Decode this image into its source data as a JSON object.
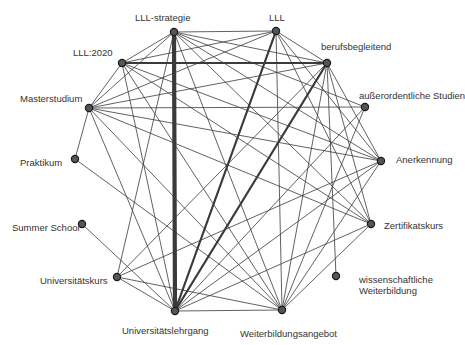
{
  "diagram": {
    "type": "network",
    "nodes": [
      {
        "id": "lll-strategie",
        "label": "LLL-strategie",
        "x": 174,
        "y": 32,
        "lx": 135,
        "ly": 12
      },
      {
        "id": "lll",
        "label": "LLL",
        "x": 276,
        "y": 31,
        "lx": 269,
        "ly": 12
      },
      {
        "id": "lll2020",
        "label": "LLL:2020",
        "x": 122,
        "y": 63,
        "lx": 73,
        "ly": 47
      },
      {
        "id": "berufsbegleitend",
        "label": "berufsbegleitend",
        "x": 327,
        "y": 63,
        "lx": 321,
        "ly": 41
      },
      {
        "id": "masterstudium",
        "label": "Masterstudium",
        "x": 89,
        "y": 108,
        "lx": 20,
        "ly": 93
      },
      {
        "id": "ausserordentliche",
        "label": "außerordentliche Studien",
        "x": 365,
        "y": 107,
        "lx": 359,
        "ly": 90
      },
      {
        "id": "praktikum",
        "label": "Praktikum",
        "x": 75,
        "y": 159,
        "lx": 20,
        "ly": 157
      },
      {
        "id": "anerkennung",
        "label": "Anerkennung",
        "x": 381,
        "y": 161,
        "lx": 396,
        "ly": 154
      },
      {
        "id": "summerschool",
        "label": "Summer School",
        "x": 82,
        "y": 224,
        "lx": 12,
        "ly": 222
      },
      {
        "id": "zertifikatskurs",
        "label": "Zertifikatskurs",
        "x": 371,
        "y": 224,
        "lx": 384,
        "ly": 220
      },
      {
        "id": "universitaetskurs",
        "label": "Universitätskurs",
        "x": 117,
        "y": 277,
        "lx": 40,
        "ly": 275
      },
      {
        "id": "wissenschaftliche",
        "label": "wissenschaftliche",
        "label2": "Weiterbildung",
        "x": 336,
        "y": 276,
        "lx": 359,
        "ly": 274
      },
      {
        "id": "universitaetslehrgang",
        "label": "Universitätslehrgang",
        "x": 175,
        "y": 311,
        "lx": 122,
        "ly": 325
      },
      {
        "id": "weiterbildungsangebot",
        "label": "Weiterbildungsangebot",
        "x": 282,
        "y": 310,
        "lx": 240,
        "ly": 328
      }
    ],
    "edges": [
      {
        "s": "lll-strategie",
        "t": "universitaetslehrgang",
        "w": 4.2
      },
      {
        "s": "lll2020",
        "t": "berufsbegleitend",
        "w": 2.0
      },
      {
        "s": "lll",
        "t": "universitaetslehrgang",
        "w": 2.2
      },
      {
        "s": "berufsbegleitend",
        "t": "universitaetslehrgang",
        "w": 2.2
      },
      {
        "s": "lll-strategie",
        "t": "lll",
        "w": 0.8
      },
      {
        "s": "lll-strategie",
        "t": "lll2020",
        "w": 0.8
      },
      {
        "s": "lll-strategie",
        "t": "masterstudium",
        "w": 0.8
      },
      {
        "s": "lll-strategie",
        "t": "berufsbegleitend",
        "w": 0.8
      },
      {
        "s": "lll-strategie",
        "t": "anerkennung",
        "w": 0.8
      },
      {
        "s": "lll-strategie",
        "t": "zertifikatskurs",
        "w": 0.8
      },
      {
        "s": "lll-strategie",
        "t": "weiterbildungsangebot",
        "w": 0.8
      },
      {
        "s": "lll-strategie",
        "t": "universitaetskurs",
        "w": 0.8
      },
      {
        "s": "lll-strategie",
        "t": "ausserordentliche",
        "w": 0.8
      },
      {
        "s": "lll",
        "t": "lll2020",
        "w": 0.8
      },
      {
        "s": "lll",
        "t": "masterstudium",
        "w": 0.8
      },
      {
        "s": "lll",
        "t": "berufsbegleitend",
        "w": 0.8
      },
      {
        "s": "lll",
        "t": "anerkennung",
        "w": 0.8
      },
      {
        "s": "lll",
        "t": "zertifikatskurs",
        "w": 0.8
      },
      {
        "s": "lll",
        "t": "weiterbildungsangebot",
        "w": 0.8
      },
      {
        "s": "lll2020",
        "t": "masterstudium",
        "w": 0.8
      },
      {
        "s": "lll2020",
        "t": "anerkennung",
        "w": 0.8
      },
      {
        "s": "lll2020",
        "t": "zertifikatskurs",
        "w": 0.8
      },
      {
        "s": "lll2020",
        "t": "universitaetslehrgang",
        "w": 0.8
      },
      {
        "s": "lll2020",
        "t": "weiterbildungsangebot",
        "w": 0.8
      },
      {
        "s": "berufsbegleitend",
        "t": "masterstudium",
        "w": 0.8
      },
      {
        "s": "berufsbegleitend",
        "t": "anerkennung",
        "w": 0.8
      },
      {
        "s": "berufsbegleitend",
        "t": "zertifikatskurs",
        "w": 0.8
      },
      {
        "s": "berufsbegleitend",
        "t": "weiterbildungsangebot",
        "w": 0.8
      },
      {
        "s": "berufsbegleitend",
        "t": "wissenschaftliche",
        "w": 0.8
      },
      {
        "s": "berufsbegleitend",
        "t": "universitaetskurs",
        "w": 0.8
      },
      {
        "s": "masterstudium",
        "t": "ausserordentliche",
        "w": 0.8
      },
      {
        "s": "masterstudium",
        "t": "anerkennung",
        "w": 0.8
      },
      {
        "s": "masterstudium",
        "t": "zertifikatskurs",
        "w": 0.8
      },
      {
        "s": "masterstudium",
        "t": "universitaetslehrgang",
        "w": 0.8
      },
      {
        "s": "masterstudium",
        "t": "weiterbildungsangebot",
        "w": 0.8
      },
      {
        "s": "masterstudium",
        "t": "praktikum",
        "w": 0.8
      },
      {
        "s": "ausserordentliche",
        "t": "universitaetslehrgang",
        "w": 0.8
      },
      {
        "s": "ausserordentliche",
        "t": "weiterbildungsangebot",
        "w": 0.8
      },
      {
        "s": "anerkennung",
        "t": "universitaetslehrgang",
        "w": 0.8
      },
      {
        "s": "anerkennung",
        "t": "weiterbildungsangebot",
        "w": 0.8
      },
      {
        "s": "anerkennung",
        "t": "universitaetskurs",
        "w": 0.8
      },
      {
        "s": "zertifikatskurs",
        "t": "universitaetslehrgang",
        "w": 0.8
      },
      {
        "s": "zertifikatskurs",
        "t": "weiterbildungsangebot",
        "w": 0.8
      },
      {
        "s": "praktikum",
        "t": "weiterbildungsangebot",
        "w": 0.8
      },
      {
        "s": "summerschool",
        "t": "universitaetslehrgang",
        "w": 0.8
      },
      {
        "s": "universitaetskurs",
        "t": "universitaetslehrgang",
        "w": 0.8
      },
      {
        "s": "universitaetskurs",
        "t": "weiterbildungsangebot",
        "w": 0.8
      },
      {
        "s": "universitaetslehrgang",
        "t": "weiterbildungsangebot",
        "w": 0.8
      }
    ]
  }
}
